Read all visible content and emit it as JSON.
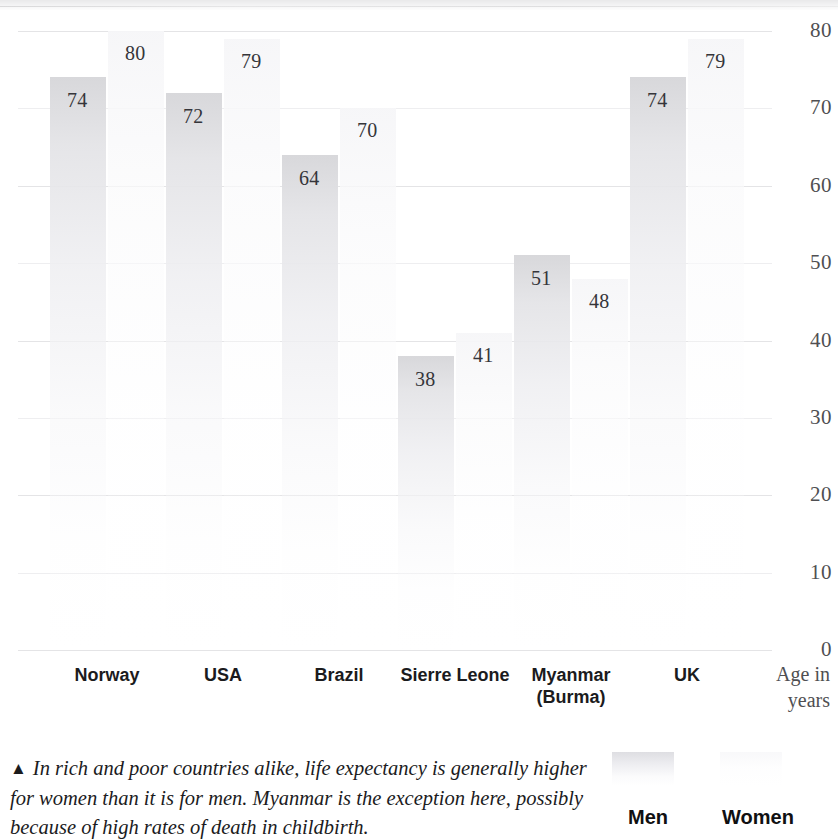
{
  "chart_data": {
    "type": "bar",
    "title": "",
    "subtitle": "",
    "xlabel": "",
    "ylabel": "Age in years",
    "ylim": [
      0,
      80
    ],
    "yticks": [
      80,
      70,
      60,
      50,
      40,
      30,
      20,
      10,
      0
    ],
    "ytick_labels": [
      "80",
      "70",
      "60",
      "50",
      "40",
      "30",
      "20",
      "10",
      "0"
    ],
    "grid": true,
    "legend_position": "bottom-right",
    "categories": [
      "Norway",
      "USA",
      "Brazil",
      "Sierre Leone",
      "Myanmar (Burma)",
      "UK"
    ],
    "series": [
      {
        "name": "Men",
        "values": [
          74,
          72,
          64,
          38,
          51,
          74
        ],
        "color": "#e6e6e9"
      },
      {
        "name": "Women",
        "values": [
          80,
          79,
          70,
          41,
          48,
          79
        ],
        "color": "#fafafb"
      }
    ],
    "annotations": [
      "In rich and poor countries alike, life expectancy is generally higher for women than it is for men. Myanmar is the exception here, possibly because of high rates of death in childbirth."
    ]
  },
  "axis": {
    "y_caption_line1": "Age in",
    "y_caption_line2": "years",
    "ticks": [
      "80",
      "70",
      "60",
      "50",
      "40",
      "30",
      "20",
      "10",
      "0"
    ]
  },
  "categories": [
    {
      "label_line1": "Norway",
      "label_line2": "",
      "men": "74",
      "women": "80"
    },
    {
      "label_line1": "USA",
      "label_line2": "",
      "men": "72",
      "women": "79"
    },
    {
      "label_line1": "Brazil",
      "label_line2": "",
      "men": "64",
      "women": "70"
    },
    {
      "label_line1": "Sierre Leone",
      "label_line2": "",
      "men": "38",
      "women": "41"
    },
    {
      "label_line1": "Myanmar",
      "label_line2": "(Burma)",
      "men": "51",
      "women": "48"
    },
    {
      "label_line1": "UK",
      "label_line2": "",
      "men": "74",
      "women": "79"
    }
  ],
  "legend": {
    "men_label": "Men",
    "women_label": "Women"
  },
  "caption": {
    "marker": "▲",
    "text": "In rich and poor countries alike, life expectancy is generally higher for women than it is for men. Myanmar is the exception here, possibly because of high rates of death in childbirth."
  }
}
